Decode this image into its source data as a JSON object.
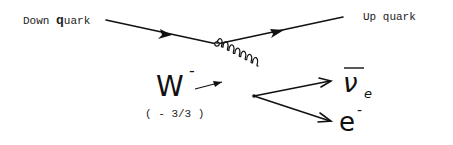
{
  "diagram": {
    "labels": {
      "down_quark_prefix": "Down ",
      "down_quark_q": "q",
      "down_quark_suffix": "uark",
      "up_quark": "Up quark",
      "w_boson": "W",
      "w_charge_sup": "-",
      "w_charge_note": "( - 3/3 )",
      "antineutrino": "ν",
      "antineutrino_sub": "e",
      "electron": "e",
      "electron_sup": "-"
    },
    "nodes": [
      {
        "id": "vertex-quark",
        "x": 217,
        "y": 44
      },
      {
        "id": "vertex-lepton",
        "x": 254,
        "y": 96
      }
    ],
    "edges": [
      {
        "from": "down-quark-start",
        "to": "vertex-quark",
        "type": "fermion",
        "arrow": "forward"
      },
      {
        "from": "vertex-quark",
        "to": "up-quark-end",
        "type": "fermion",
        "arrow": "forward"
      },
      {
        "from": "vertex-quark",
        "to": "vertex-lepton",
        "type": "boson-spring"
      },
      {
        "from": "vertex-lepton",
        "to": "antineutrino-end",
        "type": "fermion",
        "arrow": "forward"
      },
      {
        "from": "vertex-lepton",
        "to": "electron-end",
        "type": "fermion",
        "arrow": "forward"
      }
    ],
    "colors": {
      "ink": "#111111",
      "background": "#ffffff"
    }
  }
}
